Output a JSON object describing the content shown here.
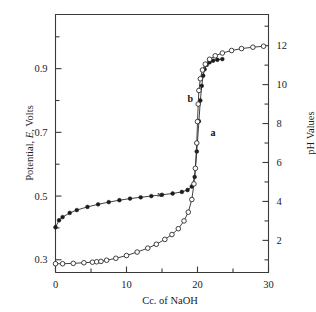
{
  "figure": {
    "background": "#ffffff",
    "ink_color": "#2b2b2b"
  },
  "chart_data": {
    "type": "line",
    "title": "",
    "xlabel": "Cc. of  NaOH",
    "ylabel": "Potential, E, Volts",
    "y2label": "pH  Values",
    "xlim": [
      0,
      30
    ],
    "ylim": [
      0.26,
      1.07
    ],
    "y2lim": [
      0.35,
      13.6
    ],
    "grid": false,
    "legend": "inline-curve-labels",
    "x_ticks": [
      0,
      10,
      20,
      30
    ],
    "x_ticklabels": [
      "0",
      "10",
      "20",
      "30"
    ],
    "x_minor_ticks": [
      5,
      15,
      25
    ],
    "y_ticks": [
      0.3,
      0.5,
      0.7,
      0.9
    ],
    "y_ticklabels": [
      "0.3",
      "0.5",
      "0.7",
      "0.9"
    ],
    "y_minor_ticks": [
      0.4,
      0.6,
      0.8,
      1.0
    ],
    "y2_ticks": [
      2,
      4,
      6,
      8,
      10,
      12
    ],
    "y2_ticklabels": [
      "2",
      "4",
      "6",
      "8",
      "10",
      "12"
    ],
    "y2_minor_ticks": [
      1,
      3,
      5,
      7,
      9,
      11,
      13
    ],
    "annotations": [
      {
        "text": "b",
        "x": 19.0,
        "y_volts": 0.795,
        "note": "label for potential curve"
      },
      {
        "text": "a",
        "x": 22.2,
        "y_volts": 0.69,
        "note": "label for pH curve"
      },
      {
        "text": "x",
        "x": 14.6,
        "y_volts": 0.498,
        "note": "small marker on potential curve"
      }
    ],
    "series": [
      {
        "name": "b",
        "label": "Potential, E, Volts",
        "marker": "filled-circle",
        "axis": "left",
        "x": [
          0.0,
          0.5,
          1.0,
          2.0,
          3.0,
          4.5,
          6.0,
          7.5,
          9.0,
          10.5,
          12.0,
          13.5,
          15.0,
          16.5,
          17.8,
          18.6,
          19.2,
          19.6,
          19.9,
          20.2,
          20.4,
          20.6,
          20.8,
          21.0,
          21.3,
          21.7,
          22.2,
          22.8,
          23.5
        ],
        "values": [
          0.402,
          0.424,
          0.434,
          0.447,
          0.456,
          0.466,
          0.474,
          0.481,
          0.487,
          0.492,
          0.496,
          0.5,
          0.504,
          0.508,
          0.513,
          0.519,
          0.53,
          0.56,
          0.64,
          0.735,
          0.8,
          0.846,
          0.878,
          0.898,
          0.912,
          0.92,
          0.925,
          0.928,
          0.93
        ]
      },
      {
        "name": "a",
        "label": "pH Values",
        "marker": "open-circle",
        "axis": "right",
        "x": [
          0.0,
          1.0,
          2.5,
          4.0,
          5.2,
          5.8,
          6.4,
          7.2,
          8.5,
          10.0,
          11.5,
          13.0,
          14.2,
          15.4,
          16.4,
          17.3,
          18.1,
          18.7,
          19.2,
          19.5,
          19.7,
          19.9,
          20.0,
          20.1,
          20.2,
          20.4,
          20.7,
          21.1,
          21.7,
          22.5,
          23.5,
          24.8,
          26.2,
          27.8,
          29.3
        ],
        "values": [
          0.8,
          0.8,
          0.82,
          0.85,
          0.88,
          0.9,
          0.92,
          0.98,
          1.08,
          1.22,
          1.4,
          1.6,
          1.8,
          2.05,
          2.3,
          2.6,
          3.0,
          3.45,
          4.1,
          4.9,
          5.7,
          7.0,
          8.1,
          9.0,
          9.7,
          10.3,
          10.75,
          11.05,
          11.3,
          11.48,
          11.62,
          11.75,
          11.85,
          11.92,
          11.97
        ]
      }
    ]
  }
}
